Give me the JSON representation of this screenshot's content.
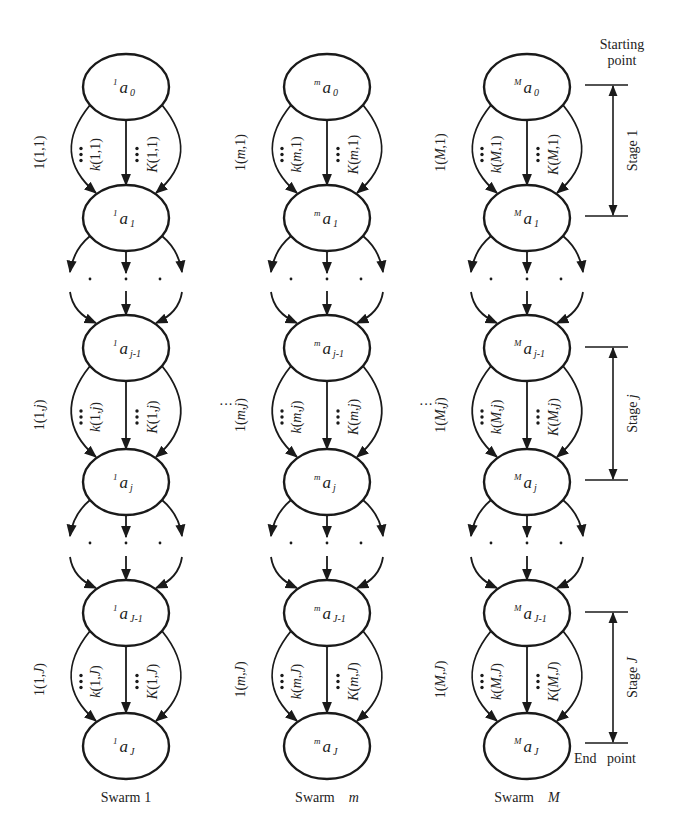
{
  "figure": {
    "type": "multi-swarm multi-stage path diagram",
    "swarms": [
      {
        "id": "1",
        "caption": "Swarm 1",
        "caption_prefix": "Swarm",
        "caption_index": "1",
        "cx": 126,
        "nodes": [
          {
            "sup": "1",
            "sub": "0"
          },
          {
            "sup": "1",
            "sub": "1"
          },
          {
            "sup": "1",
            "sub": "j-1"
          },
          {
            "sup": "1",
            "sub": "j"
          },
          {
            "sup": "1",
            "sub": "J-1"
          },
          {
            "sup": "1",
            "sub": "J"
          }
        ],
        "stage_labels": [
          {
            "left": "1(1,1)",
            "mid": "k(1,1)",
            "right": "K(1,1)"
          },
          {
            "left": "1(1,j)",
            "mid": "k(1,j)",
            "right": "K(1,j)"
          },
          {
            "left": "1(1,J)",
            "mid": "k(1,J)",
            "right": "K(1,J)"
          }
        ]
      },
      {
        "id": "m",
        "caption": "Swarm m",
        "caption_prefix": "Swarm",
        "caption_index": "m",
        "cx": 327,
        "nodes": [
          {
            "sup": "m",
            "sub": "0"
          },
          {
            "sup": "m",
            "sub": "1"
          },
          {
            "sup": "m",
            "sub": "j-1"
          },
          {
            "sup": "m",
            "sub": "j"
          },
          {
            "sup": "m",
            "sub": "J-1"
          },
          {
            "sup": "m",
            "sub": "J"
          }
        ],
        "stage_labels": [
          {
            "left": "1(m,1)",
            "mid": "k(m,1)",
            "right": "K(m,1)"
          },
          {
            "left": "1(m,j)",
            "mid": "k(m,j)",
            "right": "K(m,j)"
          },
          {
            "left": "1(m,J)",
            "mid": "k(m,J)",
            "right": "K(m,J)"
          }
        ]
      },
      {
        "id": "M",
        "caption": "Swarm M",
        "caption_prefix": "Swarm",
        "caption_index": "M",
        "cx": 527,
        "nodes": [
          {
            "sup": "M",
            "sub": "0"
          },
          {
            "sup": "M",
            "sub": "1"
          },
          {
            "sup": "M",
            "sub": "j-1"
          },
          {
            "sup": "M",
            "sub": "j"
          },
          {
            "sup": "M",
            "sub": "J-1"
          },
          {
            "sup": "M",
            "sub": "J"
          }
        ],
        "stage_labels": [
          {
            "left": "1(M,1)",
            "mid": "k(M,1)",
            "right": "K(M,1)"
          },
          {
            "left": "1(M,j)",
            "mid": "k(M,j)",
            "right": "K(M,j)"
          },
          {
            "left": "1(M,J)",
            "mid": "k(M,J)",
            "right": "K(M,J)"
          }
        ]
      }
    ],
    "node_symbol": "a",
    "between_swarms_ellipsis": "···",
    "stage_annotations": [
      {
        "label": "Stage 1",
        "prefix": "Stage",
        "index": "1"
      },
      {
        "label": "Stage j",
        "prefix": "Stage",
        "index": "j"
      },
      {
        "label": "Stage J",
        "prefix": "Stage",
        "index": "J"
      }
    ],
    "starting_point": {
      "line1": "Starting",
      "line2": "point"
    },
    "end_point": "End   point"
  }
}
